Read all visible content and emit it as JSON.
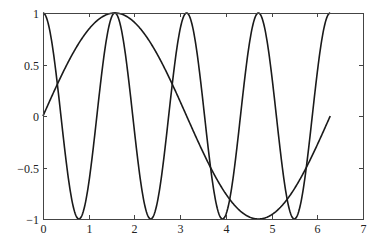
{
  "chart_data": {
    "type": "line",
    "title": "",
    "xlabel": "",
    "ylabel": "",
    "xlim": [
      0,
      7
    ],
    "ylim": [
      -1,
      1
    ],
    "grid": false,
    "legend": null,
    "xticks": [
      "0",
      "1",
      "2",
      "3",
      "4",
      "5",
      "6",
      "7"
    ],
    "yticks": [
      "-1",
      "-0.5",
      "0",
      "0.5",
      "1"
    ],
    "series": [
      {
        "name": "sin(x)",
        "function": "sin",
        "freq": 1,
        "x_range": [
          0,
          6.2832
        ],
        "color": "#1a1a1a"
      },
      {
        "name": "cos(4x)",
        "function": "cos",
        "freq": 4,
        "x_range": [
          0,
          6.2832
        ],
        "color": "#1a1a1a"
      }
    ]
  },
  "layout": {
    "plot_left": 43,
    "plot_right": 363,
    "plot_top": 13,
    "plot_bottom": 219
  }
}
